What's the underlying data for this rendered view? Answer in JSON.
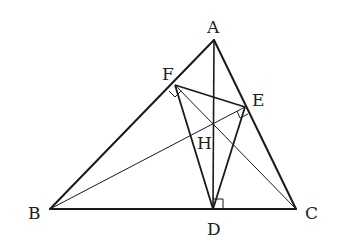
{
  "diagram": {
    "type": "geometry",
    "points": {
      "A": {
        "label": "A",
        "x": 214,
        "y": 40
      },
      "B": {
        "label": "B",
        "x": 50,
        "y": 209
      },
      "C": {
        "label": "C",
        "x": 296,
        "y": 209
      },
      "D": {
        "label": "D",
        "x": 213,
        "y": 209
      },
      "E": {
        "label": "E",
        "x": 245,
        "y": 107
      },
      "F": {
        "label": "F",
        "x": 175,
        "y": 85
      },
      "H": {
        "label": "H",
        "x": 214,
        "y": 124
      }
    },
    "segments": [
      {
        "from": "A",
        "to": "B",
        "weight": "thick"
      },
      {
        "from": "A",
        "to": "C",
        "weight": "thick"
      },
      {
        "from": "B",
        "to": "C",
        "weight": "thick"
      },
      {
        "from": "A",
        "to": "D",
        "weight": "thick"
      },
      {
        "from": "F",
        "to": "E",
        "weight": "thick"
      },
      {
        "from": "F",
        "to": "D",
        "weight": "thick"
      },
      {
        "from": "E",
        "to": "D",
        "weight": "thick"
      },
      {
        "from": "B",
        "to": "E",
        "weight": "thin"
      },
      {
        "from": "C",
        "to": "F",
        "weight": "thin"
      }
    ],
    "right_angles": [
      "F",
      "E",
      "D"
    ],
    "colors": {
      "line": "#1a1a1a",
      "background": "#ffffff"
    }
  },
  "labels": {
    "A": "A",
    "B": "B",
    "C": "C",
    "D": "D",
    "E": "E",
    "F": "F",
    "H": "H"
  }
}
